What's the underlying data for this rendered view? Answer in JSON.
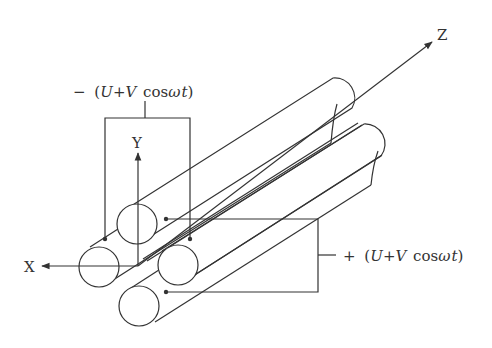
{
  "diagram": {
    "axes": {
      "x_label": "X",
      "y_label": "Y",
      "z_label": "Z"
    },
    "voltages": {
      "negative": {
        "sign": "−",
        "open": "(",
        "U": "U",
        "plus": "+",
        "V": "V",
        "cos": "cos",
        "omega": "ω",
        "t": "t",
        "close": ")",
        "text": "− (U+V cosωt)"
      },
      "positive": {
        "sign": "+",
        "open": "(",
        "U": "U",
        "plus": "+",
        "V": "V",
        "cos": "cos",
        "omega": "ω",
        "t": "t",
        "close": ")",
        "text": "+ (U+V cosωt)"
      }
    },
    "rods": [
      {
        "name": "rod-x-left",
        "pair": "negative"
      },
      {
        "name": "rod-y-top",
        "pair": "positive"
      },
      {
        "name": "rod-x-right",
        "pair": "negative"
      },
      {
        "name": "rod-y-bottom",
        "pair": "positive"
      }
    ],
    "colors": {
      "line": "#333333",
      "background": "#ffffff"
    }
  }
}
